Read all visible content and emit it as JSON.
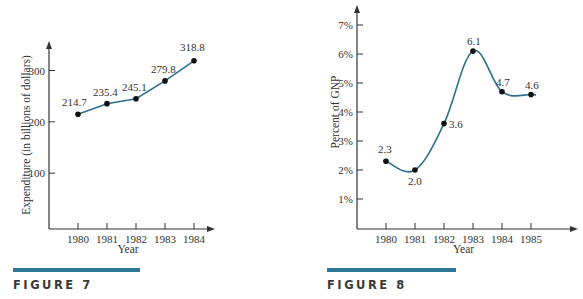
{
  "colors": {
    "line": "#2e6f8e",
    "bar": "#2f7796",
    "axis": "#333333",
    "point": "#111111"
  },
  "figures": [
    {
      "caption": "FIGURE 7"
    },
    {
      "caption": "FIGURE 8"
    }
  ],
  "chart_data": [
    {
      "type": "line",
      "title": "",
      "caption": "FIGURE 7",
      "xlabel": "Year",
      "ylabel": "Expenditure (in billions of dollars)",
      "x": [
        1980,
        1981,
        1982,
        1983,
        1984
      ],
      "x_tick_labels": [
        "1980",
        "1981",
        "1982",
        "1983",
        "1984"
      ],
      "y_ticks": [
        100,
        200,
        300
      ],
      "y_tick_labels": [
        "100",
        "200",
        "300"
      ],
      "values": [
        214.7,
        235.4,
        245.1,
        279.8,
        318.8
      ],
      "data_labels": [
        "214.7",
        "235.4",
        "245.1",
        "279.8",
        "318.8"
      ],
      "ylim": [
        0,
        350
      ],
      "grid": false,
      "legend": null,
      "line_style": "straight segments with dot markers"
    },
    {
      "type": "line",
      "title": "",
      "caption": "FIGURE 8",
      "xlabel": "Year",
      "ylabel": "Percent of GNP",
      "x": [
        1980,
        1981,
        1982,
        1983,
        1984,
        1985
      ],
      "x_tick_labels": [
        "1980",
        "1981",
        "1982",
        "1983",
        "1984",
        "1985"
      ],
      "y_ticks": [
        1,
        2,
        3,
        4,
        5,
        6,
        7
      ],
      "y_tick_labels": [
        "1%",
        "2%",
        "3%",
        "4%",
        "5%",
        "6%",
        "7%"
      ],
      "values": [
        2.3,
        2.0,
        3.6,
        6.1,
        4.7,
        4.6
      ],
      "data_labels": [
        "2.3",
        "2.0",
        "3.6",
        "6.1",
        "4.7",
        "4.6"
      ],
      "ylim": [
        0,
        7.5
      ],
      "grid": false,
      "legend": null,
      "line_style": "smooth curve with dot markers"
    }
  ]
}
